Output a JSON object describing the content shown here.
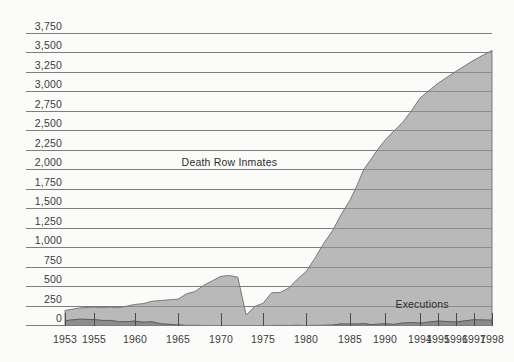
{
  "chart_data": {
    "type": "area",
    "title": "",
    "subtitle": "",
    "xlabel": "",
    "ylabel": "",
    "ylim": [
      0,
      3750
    ],
    "ytick_step": 250,
    "grid": true,
    "legend_position": "inline-annotation",
    "annotations": [
      {
        "text": "Death Row Inmates",
        "x": 1971,
        "y": 2050
      },
      {
        "text": "Executions",
        "x": 1995.6,
        "y": 230
      }
    ],
    "ytick_labels": [
      "3,750",
      "3,500",
      "3,250",
      "3,000",
      "2,750",
      "2,500",
      "2,250",
      "2,000",
      "1,750",
      "1,500",
      "1,250",
      "1,000",
      "750",
      "500",
      "250",
      "0"
    ],
    "ytick_values": [
      3750,
      3500,
      3250,
      3000,
      2750,
      2500,
      2250,
      2000,
      1750,
      1500,
      1250,
      1000,
      750,
      500,
      250,
      0
    ],
    "xtick_labels": [
      "1953",
      "1955",
      "1960",
      "1965",
      "1970",
      "1975",
      "1980",
      "1985",
      "1990",
      "1994",
      "1995",
      "1996",
      "1997",
      "1998"
    ],
    "xtick_values": [
      1953,
      1955,
      1960,
      1965,
      1970,
      1975,
      1980,
      1985,
      1990,
      1994,
      1995,
      1996,
      1997,
      1998
    ],
    "x_axis_note": "non-linear: 1953-1990 compressed, 1994-1998 evenly spread",
    "series": [
      {
        "name": "Death Row Inmates",
        "color": "#b9b9b9",
        "x": [
          1953,
          1954,
          1955,
          1956,
          1957,
          1958,
          1959,
          1960,
          1961,
          1962,
          1963,
          1964,
          1965,
          1966,
          1967,
          1968,
          1969,
          1970,
          1971,
          1972,
          1973,
          1974,
          1975,
          1976,
          1977,
          1978,
          1979,
          1980,
          1981,
          1982,
          1983,
          1984,
          1985,
          1986,
          1987,
          1988,
          1989,
          1990,
          1991,
          1992,
          1993,
          1994,
          1995,
          1996,
          1997,
          1998
        ],
        "values": [
          130,
          145,
          160,
          165,
          170,
          180,
          200,
          215,
          240,
          265,
          300,
          315,
          330,
          406,
          435,
          517,
          575,
          631,
          642,
          620,
          134,
          244,
          285,
          420,
          423,
          482,
          593,
          691,
          860,
          1050,
          1209,
          1405,
          1591,
          1781,
          1984,
          2124,
          2250,
          2356,
          2482,
          2575,
          2716,
          2890,
          3054,
          3219,
          3335,
          3465
        ]
      },
      {
        "name": "Executions",
        "color": "#8c8c8c",
        "x": [
          1953,
          1954,
          1955,
          1956,
          1957,
          1958,
          1959,
          1960,
          1961,
          1962,
          1963,
          1964,
          1965,
          1966,
          1967,
          1968,
          1969,
          1970,
          1971,
          1972,
          1973,
          1974,
          1975,
          1976,
          1977,
          1978,
          1979,
          1980,
          1981,
          1982,
          1983,
          1984,
          1985,
          1986,
          1987,
          1988,
          1989,
          1990,
          1991,
          1992,
          1993,
          1994,
          1995,
          1996,
          1997,
          1998
        ],
        "values": [
          62,
          81,
          76,
          65,
          65,
          49,
          49,
          56,
          42,
          47,
          21,
          15,
          7,
          1,
          2,
          0,
          0,
          0,
          0,
          0,
          0,
          0,
          0,
          0,
          1,
          0,
          2,
          0,
          1,
          2,
          5,
          21,
          18,
          18,
          25,
          11,
          16,
          23,
          14,
          31,
          38,
          31,
          56,
          45,
          74,
          68
        ]
      }
    ]
  }
}
